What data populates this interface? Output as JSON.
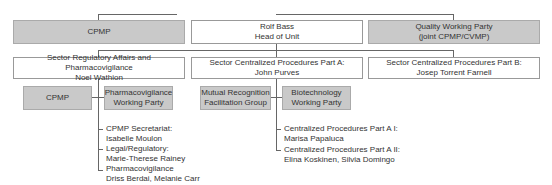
{
  "top_row": {
    "left": {
      "line1": "CPMP"
    },
    "center": {
      "line1": "Rolf Bass",
      "line2": "Head of Unit"
    },
    "right": {
      "line1": "Quality Working Party",
      "line2": "(joint CPMP/CVMP)"
    }
  },
  "sectors": [
    {
      "line1": "Sector Regulatory Affairs and Pharmacovigilance",
      "line2": "Noel Wathion"
    },
    {
      "line1": "Sector Centralized Procedures Part A:",
      "line2": "John Purves"
    },
    {
      "line1": "Sector Centralized Procedures Part B:",
      "line2": "Josep Torrent Farnell"
    }
  ],
  "sector_a_groups": [
    {
      "line1": "CPMP"
    },
    {
      "line1": "Pharmacovigilance",
      "line2": "Working Party"
    }
  ],
  "sector_b_groups": [
    {
      "line1": "Mutual Recognition",
      "line2": "Facilitation Group"
    },
    {
      "line1": "Biotechnology",
      "line2": "Working Party"
    }
  ],
  "sector_a_units": [
    {
      "title": "CPMP Secretariat:",
      "names": "Isabelle Moulon"
    },
    {
      "title": "Legal/Regulatory:",
      "names": "Marie-Therese Rainey"
    },
    {
      "title": "Pharmacovigilance",
      "names": "Driss Berdai, Melanie Carr"
    }
  ],
  "sector_b_units": [
    {
      "title": "Centralized Procedures Part A I:",
      "names": "Marisa Papaluca"
    },
    {
      "title": "Centralized Procedures Part A II:",
      "names": "Elina Koskinen, Silvia Domingo"
    }
  ]
}
